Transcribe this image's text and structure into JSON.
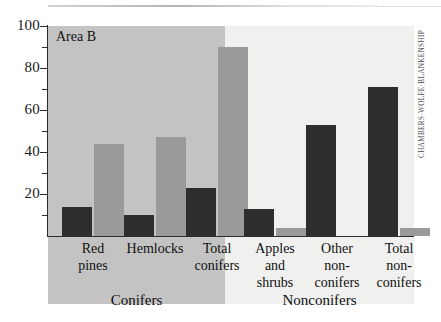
{
  "figure": {
    "area_label": "Area B",
    "credit": "CHAMBERS·WOLFE·BLANKENSHIP"
  },
  "chart_data": {
    "type": "bar",
    "title": "Area B",
    "xlabel": "",
    "ylabel": "",
    "ylim": [
      0,
      100
    ],
    "y_ticks_major": [
      100,
      80,
      60,
      40,
      20
    ],
    "y_ticks_minor": [
      90,
      70,
      50,
      30,
      10
    ],
    "grid": false,
    "legend_position": "none",
    "categories": [
      "Red pines",
      "Hemlocks",
      "Total conifers",
      "Apples and shrubs",
      "Other non-conifers",
      "Total non-conifers"
    ],
    "category_lines": [
      [
        "Red",
        "pines"
      ],
      [
        "Hemlocks"
      ],
      [
        "Total",
        "conifers"
      ],
      [
        "Apples",
        "and",
        "shrubs"
      ],
      [
        "Other",
        "non-",
        "conifers"
      ],
      [
        "Total",
        "non-",
        "conifers"
      ]
    ],
    "groups": [
      {
        "label": "Conifers",
        "categories": [
          0,
          1,
          2
        ]
      },
      {
        "label": "Nonconifers",
        "categories": [
          3,
          4,
          5
        ]
      }
    ],
    "series": [
      {
        "name": "dark",
        "color": "#2e2e2e",
        "values": [
          14,
          10,
          23,
          13,
          53,
          71
        ]
      },
      {
        "name": "gray",
        "color": "#9a9a9a",
        "values": [
          44,
          47,
          90,
          4,
          0,
          4
        ]
      }
    ]
  },
  "colors": {
    "band_conifers": "#c3c3c3",
    "band_nonconifers": "#f0f0ef",
    "bar_dark": "#2e2e2e",
    "bar_gray": "#9a9a9a",
    "axis": "#2b2b2b",
    "page": "#ffffff"
  },
  "axis_labels": {
    "y": [
      "100",
      "80",
      "60",
      "40",
      "20"
    ]
  }
}
